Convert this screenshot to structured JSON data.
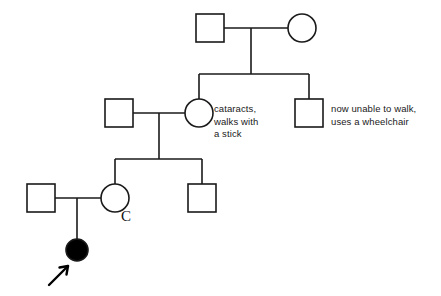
{
  "diagram": {
    "type": "pedigree-chart",
    "stroke_color": "#1a1a1a",
    "fill_affected": "#000000",
    "fill_unaffected": "#ffffff",
    "background": "#ffffff",
    "stroke_width": 1.6
  },
  "annotations": {
    "cataracts_note": "cataracts,\nwalks with\na stick",
    "wheelchair_note": "now unable to walk,\nuses a wheelchair",
    "carrier_mark": "C"
  },
  "symbols": {
    "male": "square",
    "female": "circle",
    "affected": "filled",
    "unaffected": "open",
    "proband_marker": "arrow"
  },
  "generations": [
    {
      "id": "I",
      "individuals": [
        {
          "id": "I-1",
          "sex": "male",
          "shape": "square",
          "affected": false,
          "cx": 210,
          "cy": 28
        },
        {
          "id": "I-2",
          "sex": "female",
          "shape": "circle",
          "affected": false,
          "cx": 302,
          "cy": 28
        }
      ]
    },
    {
      "id": "II",
      "individuals": [
        {
          "id": "II-1",
          "sex": "male",
          "shape": "square",
          "affected": false,
          "cx": 119,
          "cy": 113
        },
        {
          "id": "II-2",
          "sex": "female",
          "shape": "circle",
          "affected": false,
          "cx": 199,
          "cy": 113,
          "note": "cataracts_note"
        },
        {
          "id": "II-3",
          "sex": "male",
          "shape": "square",
          "affected": false,
          "cx": 309,
          "cy": 113,
          "note": "wheelchair_note"
        }
      ]
    },
    {
      "id": "III",
      "individuals": [
        {
          "id": "III-1",
          "sex": "male",
          "shape": "square",
          "affected": false,
          "cx": 41,
          "cy": 198
        },
        {
          "id": "III-2",
          "sex": "female",
          "shape": "circle",
          "affected": false,
          "cx": 115,
          "cy": 198,
          "note": "carrier_mark"
        },
        {
          "id": "III-3",
          "sex": "male",
          "shape": "square",
          "affected": false,
          "cx": 202,
          "cy": 198
        }
      ]
    },
    {
      "id": "IV",
      "individuals": [
        {
          "id": "IV-1",
          "sex": "female",
          "shape": "circle",
          "affected": true,
          "proband": true,
          "cx": 77,
          "cy": 250
        }
      ]
    }
  ]
}
